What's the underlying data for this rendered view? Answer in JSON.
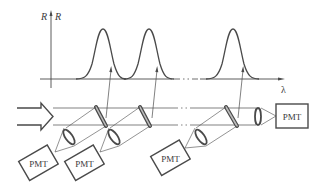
{
  "diagram": {
    "type": "optical-schematic",
    "spectrum_plot": {
      "y_axis_labels": [
        "R",
        "R"
      ],
      "x_axis_label": "λ",
      "peaks": [
        {
          "id": 1,
          "center_x": 103
        },
        {
          "id": 2,
          "center_x": 149
        },
        {
          "id": 3,
          "center_x": 233
        }
      ],
      "gap_marker": "- · · -"
    },
    "optics": {
      "input_beam": "hollow-arrow",
      "filters": 3,
      "lenses": 4,
      "detectors": [
        {
          "label": "PMT"
        },
        {
          "label": "PMT"
        },
        {
          "label": "PMT"
        },
        {
          "label": "PMT"
        }
      ]
    },
    "colors": {
      "ink": "#4a4a4a",
      "background": "#ffffff"
    }
  }
}
